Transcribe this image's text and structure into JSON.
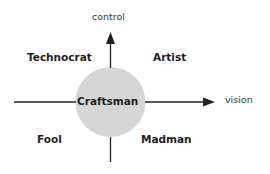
{
  "diagram": {
    "axes": {
      "vertical_label": "control",
      "horizontal_label": "vision"
    },
    "center": {
      "label": "Craftsman",
      "fill": "#d6d6d6"
    },
    "quadrants": {
      "top_left": "Technocrat",
      "top_right": "Artist",
      "bottom_left": "Fool",
      "bottom_right": "Madman"
    },
    "colors": {
      "line": "#222222",
      "text": "#1e1e1e"
    }
  }
}
